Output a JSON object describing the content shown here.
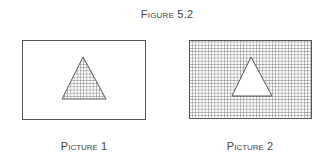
{
  "figure": {
    "title": "Figure 5.2"
  },
  "pictures": [
    {
      "caption": "Picture 1",
      "description": "Outlined rectangle with a grid-hatched triangle in the center",
      "box": {
        "x": 22,
        "y": 40,
        "w": 123,
        "h": 79,
        "fill": "none"
      },
      "triangle": {
        "apex": [
          83,
          57
        ],
        "base_left": [
          62,
          99
        ],
        "base_right": [
          106,
          99
        ],
        "fill": "grid"
      }
    },
    {
      "caption": "Picture 2",
      "description": "Grid-hatched rectangle with a blank white triangle in the center",
      "box": {
        "x": 189,
        "y": 40,
        "w": 122,
        "h": 78,
        "fill": "grid"
      },
      "triangle": {
        "apex": [
          251,
          57
        ],
        "base_left": [
          232,
          96
        ],
        "base_right": [
          272,
          96
        ],
        "fill": "white"
      }
    }
  ],
  "colors": {
    "stroke": "#555555",
    "grid": "#666666",
    "background": "#ffffff"
  }
}
